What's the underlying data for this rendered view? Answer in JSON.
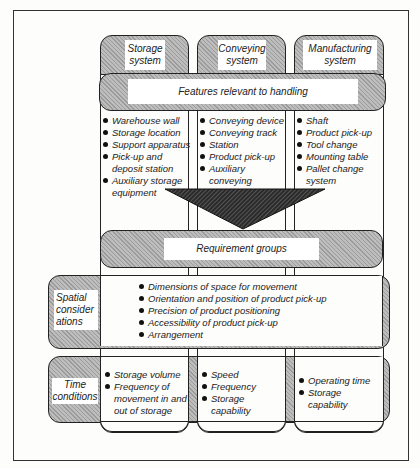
{
  "diagram": {
    "columns": [
      {
        "title": "Storage system",
        "features": [
          "Warehouse wall",
          "Storage location",
          "Support apparatus",
          "Pick-up and deposit station",
          "Auxiliary storage equipment"
        ],
        "time": [
          "Storage volume",
          "Frequency of movement in and out of storage"
        ]
      },
      {
        "title": "Conveying system",
        "features": [
          "Conveying device",
          "Conveying track",
          "Station",
          "Product pick-up",
          "Auxiliary conveying equipment"
        ],
        "time": [
          "Speed",
          "Frequency",
          "Storage capability"
        ]
      },
      {
        "title": "Manufacturing system",
        "features": [
          "Shaft",
          "Product pick-up",
          "Tool change",
          "Mounting table",
          "Pallet change system"
        ],
        "time": [
          "Operating time",
          "Storage capability"
        ]
      }
    ],
    "features_band": "Features relevant to handling",
    "requirement_band": "Requirement groups",
    "spatial": {
      "label": "Spatial consider ations",
      "items": [
        "Dimensions of space for movement",
        "Orientation and position of product pick-up",
        "Precision of product positioning",
        "Accessibility of product pick-up",
        "Arrangement"
      ]
    },
    "time_label": "Time conditions"
  },
  "colors": {
    "stroke": "#222222",
    "hatch": "#bdbdbd",
    "arrow": "#2a2a2a",
    "background": "#fdfdfb"
  }
}
